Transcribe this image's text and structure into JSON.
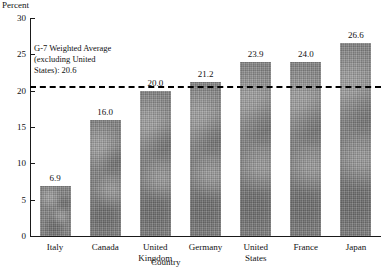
{
  "chart_data": {
    "type": "bar",
    "title": "",
    "xlabel": "Country",
    "ylabel": "Percent",
    "categories": [
      "Italy",
      "Canada",
      "United Kingdom",
      "Germany",
      "United States",
      "France",
      "Japan"
    ],
    "category_lines": [
      [
        "Italy"
      ],
      [
        "Canada"
      ],
      [
        "United",
        "Kingdom"
      ],
      [
        "Germany"
      ],
      [
        "United",
        "States"
      ],
      [
        "France"
      ],
      [
        "Japan"
      ]
    ],
    "values": [
      6.9,
      16.0,
      20.0,
      21.2,
      23.9,
      24.0,
      26.6
    ],
    "value_labels": [
      "6.9",
      "16.0",
      "20.0",
      "21.2",
      "23.9",
      "24.0",
      "26.6"
    ],
    "ylim": [
      0,
      30
    ],
    "yticks": [
      0,
      5,
      10,
      15,
      20,
      25,
      30
    ],
    "ytick_labels": [
      "0",
      "5",
      "10",
      "15",
      "20",
      "25",
      "30"
    ],
    "grid": false,
    "legend": "none",
    "bar_color": "#858585",
    "axis_color": "#1a1a1a",
    "reference_line": {
      "value": 20.6,
      "style": "dashed",
      "color": "#000000",
      "label_lines": [
        "G-7 Weighted Average",
        "(excluding United",
        "States): 20.6"
      ]
    }
  }
}
